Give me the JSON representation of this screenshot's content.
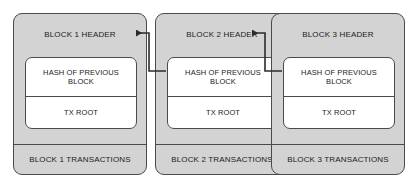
{
  "diagram": {
    "background_color": "#ffffff",
    "block_fill_color": "#d3d3d3",
    "inner_fill_color": "#ffffff",
    "stroke_color": "#4a4a4a",
    "text_color": "#1b1b1b"
  },
  "blocks": [
    {
      "id": "block-1",
      "header": "BLOCK 1 HEADER",
      "hash_label": "HASH OF PREVIOUS BLOCK",
      "tx_root_label": "TX ROOT",
      "transactions_label": "BLOCK 1 TRANSACTIONS"
    },
    {
      "id": "block-2",
      "header": "BLOCK 2 HEADER",
      "hash_label": "HASH OF PREVIOUS BLOCK",
      "tx_root_label": "TX ROOT",
      "transactions_label": "BLOCK 2 TRANSACTIONS"
    },
    {
      "id": "block-3",
      "header": "BLOCK 3 HEADER",
      "hash_label": "HASH OF PREVIOUS BLOCK",
      "tx_root_label": "TX ROOT",
      "transactions_label": "BLOCK 3 TRANSACTIONS"
    }
  ],
  "connectors": [
    {
      "id": "arrow-block2-to-block1",
      "from": "block-2 hash of previous block",
      "to": "block-1 header",
      "direction": "left"
    },
    {
      "id": "arrow-block3-to-block2",
      "from": "block-3 hash of previous block",
      "to": "block-2 header",
      "direction": "left"
    }
  ]
}
